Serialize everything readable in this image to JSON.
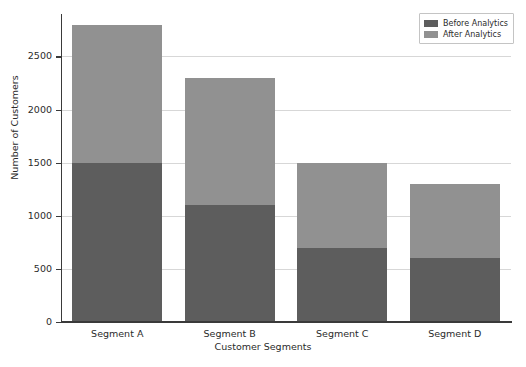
{
  "chart_data": {
    "type": "bar",
    "subtype": "stacked",
    "title": "",
    "xlabel": "Customer Segments",
    "ylabel": "Number of Customers",
    "categories": [
      "Segment A",
      "Segment B",
      "Segment C",
      "Segment D"
    ],
    "series": [
      {
        "name": "Before Analytics",
        "values": [
          1500,
          1100,
          700,
          600
        ],
        "color": "#5d5d5d"
      },
      {
        "name": "After Analytics",
        "values": [
          1300,
          1200,
          800,
          700
        ],
        "color": "#919191"
      }
    ],
    "totals": [
      2800,
      2300,
      1500,
      1300
    ],
    "ylim": [
      0,
      2900
    ],
    "yticks": [
      0,
      500,
      1000,
      1500,
      2000,
      2500
    ],
    "ytick_labels": [
      "0",
      "500",
      "1000",
      "1500",
      "2000",
      "2500"
    ],
    "grid": true,
    "grid_axis": "y",
    "legend_position": "upper right",
    "legend_entries": [
      "Before Analytics",
      "After Analytics"
    ],
    "background_color": "#ffffff",
    "axis_color": "#3a3a3a",
    "grid_color": "#d7d7d7"
  }
}
